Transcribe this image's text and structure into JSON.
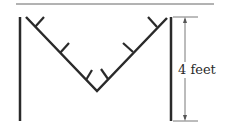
{
  "diagram": {
    "dimension_label": "4 feet",
    "colors": {
      "stroke": "#2a2a2a",
      "thin": "#555555",
      "background": "#ffffff"
    }
  }
}
